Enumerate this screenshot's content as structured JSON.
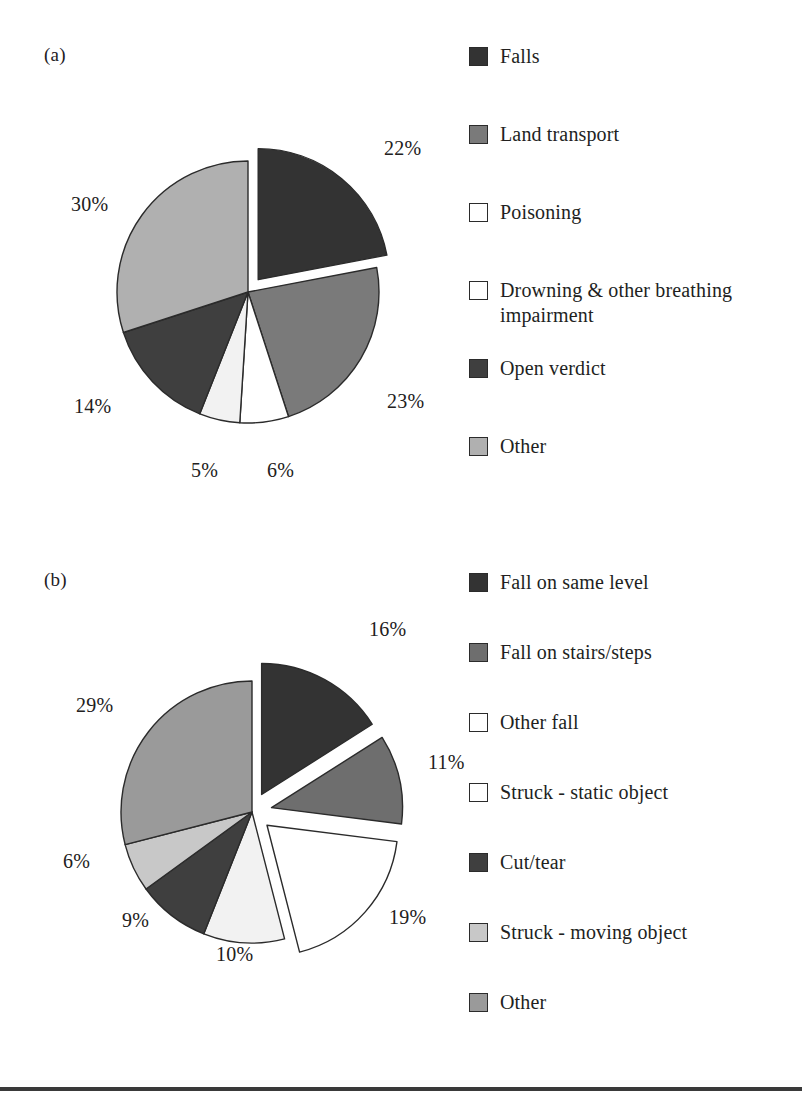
{
  "figure": {
    "background": "#ffffff",
    "rule_color": "#3a3a3a"
  },
  "panels": {
    "a": {
      "letter": "(a)"
    },
    "b": {
      "letter": "(b)"
    }
  },
  "palette": {
    "very_dark": "#333333",
    "dark": "#3f3f3f",
    "medium_dark": "#6e6e6e",
    "medium": "#7a7a7a",
    "medium_light": "#9a9a9a",
    "light": "#b0b0b0",
    "lighter": "#c8c8c8",
    "near_white": "#f2f2f2",
    "white": "#ffffff",
    "outline": "#2b2b2b",
    "text": "#221f1e"
  },
  "chart_data": [
    {
      "type": "pie",
      "id": "a",
      "title": "(a)",
      "start_angle_deg": 0,
      "direction": "clockwise",
      "legend_position": "right",
      "categories": [
        "Falls",
        "Land transport",
        "Poisoning",
        "Drowning & other breathing impairment",
        "Open verdict",
        "Other"
      ],
      "slice_order": [
        "Falls",
        "Land transport",
        "Drowning & other breathing impairment",
        "Poisoning",
        "Open verdict",
        "Other"
      ],
      "values": [
        22,
        23,
        6,
        5,
        14,
        30
      ],
      "labels": [
        "22%",
        "23%",
        "6%",
        "5%",
        "14%",
        "30%"
      ],
      "colors": [
        "#333333",
        "#7a7a7a",
        "#ffffff",
        "#f2f2f2",
        "#3f3f3f",
        "#b0b0b0"
      ],
      "exploded": [
        true,
        false,
        false,
        false,
        false,
        false
      ],
      "legend": [
        {
          "label": "Falls",
          "color": "#333333"
        },
        {
          "label": "Land transport",
          "color": "#7a7a7a"
        },
        {
          "label": "Poisoning",
          "color": "#ffffff"
        },
        {
          "label": "Drowning & other breathing impairment",
          "color": "#ffffff"
        },
        {
          "label": "Open verdict",
          "color": "#3f3f3f"
        },
        {
          "label": "Other",
          "color": "#b0b0b0"
        }
      ]
    },
    {
      "type": "pie",
      "id": "b",
      "title": "(b)",
      "start_angle_deg": 0,
      "direction": "clockwise",
      "legend_position": "right",
      "categories": [
        "Fall on same level",
        "Fall on stairs/steps",
        "Other fall",
        "Struck - static object",
        "Cut/tear",
        "Struck - moving object",
        "Other"
      ],
      "slice_order": [
        "Fall on same level",
        "Fall on stairs/steps",
        "Other fall",
        "Struck - static object",
        "Cut/tear",
        "Struck - moving object",
        "Other"
      ],
      "values": [
        16,
        11,
        19,
        10,
        9,
        6,
        29
      ],
      "labels": [
        "16%",
        "11%",
        "19%",
        "10%",
        "9%",
        "6%",
        "29%"
      ],
      "colors": [
        "#333333",
        "#6e6e6e",
        "#ffffff",
        "#f2f2f2",
        "#3f3f3f",
        "#c8c8c8",
        "#9a9a9a"
      ],
      "exploded": [
        true,
        true,
        true,
        false,
        false,
        false,
        false
      ],
      "legend": [
        {
          "label": "Fall on same level",
          "color": "#333333"
        },
        {
          "label": "Fall on stairs/steps",
          "color": "#6e6e6e"
        },
        {
          "label": "Other fall",
          "color": "#ffffff"
        },
        {
          "label": "Struck - static object",
          "color": "#ffffff"
        },
        {
          "label": "Cut/tear",
          "color": "#3f3f3f"
        },
        {
          "label": "Struck - moving object",
          "color": "#c8c8c8"
        },
        {
          "label": "Other",
          "color": "#9a9a9a"
        }
      ]
    }
  ]
}
